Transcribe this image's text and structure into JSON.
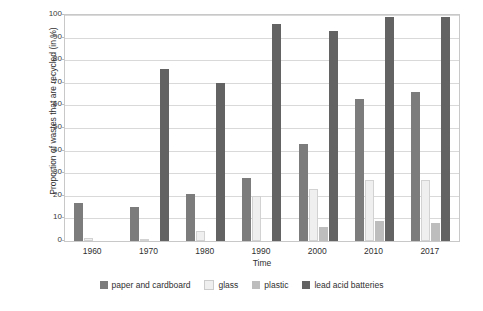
{
  "chart_data": {
    "type": "bar",
    "title": "",
    "xlabel": "Time",
    "ylabel": "Proportion of wastes that are recycled (in %)",
    "categories": [
      "1960",
      "1970",
      "1980",
      "1990",
      "2000",
      "2010",
      "2017"
    ],
    "ylim": [
      0,
      100
    ],
    "yticks": [
      "0",
      "10",
      "20",
      "30",
      "40",
      "50",
      "60",
      "70",
      "80",
      "90",
      "100"
    ],
    "grid": true,
    "legend_position": "bottom",
    "series": [
      {
        "name": "paper and cardboard",
        "color": "#7c7c7c",
        "values": [
          17,
          15,
          21,
          28,
          43,
          63,
          66
        ]
      },
      {
        "name": "glass",
        "color": "#efefef",
        "values": [
          1.5,
          1,
          4.5,
          20,
          23,
          27,
          27
        ]
      },
      {
        "name": "plastic",
        "color": "#bdbdbd",
        "values": [
          0,
          0,
          0,
          0,
          6,
          9,
          8
        ]
      },
      {
        "name": "lead acid batteries",
        "color": "#636363",
        "values": [
          0,
          76,
          70,
          96,
          93,
          99,
          99
        ]
      }
    ]
  }
}
